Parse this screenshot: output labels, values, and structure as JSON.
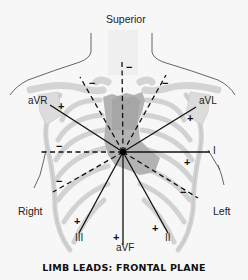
{
  "figure": {
    "caption": "LIMB LEADS: FRONTAL PLANE",
    "orientation": {
      "superior": "Superior",
      "right": "Right",
      "left": "Left"
    },
    "leads": [
      {
        "id": "I",
        "label": "I"
      },
      {
        "id": "II",
        "label": "II"
      },
      {
        "id": "III",
        "label": "III"
      },
      {
        "id": "aVR",
        "label": "aVR"
      },
      {
        "id": "aVL",
        "label": "aVL"
      },
      {
        "id": "aVF",
        "label": "aVF"
      }
    ],
    "signs": {
      "positive": "+",
      "negative": "−"
    },
    "colors": {
      "background": "#f7f7f7",
      "bone": "#dcdcdc",
      "bone_outline": "#b5b5b5",
      "sternum": "#a9a9a9",
      "lead_line": "#111111",
      "body_outline": "#555555"
    }
  }
}
